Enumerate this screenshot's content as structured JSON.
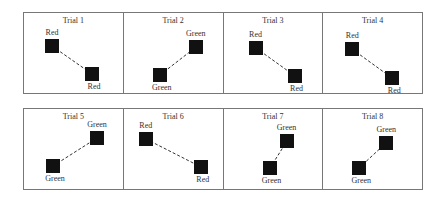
{
  "trials": [
    {
      "title": "Trial 1",
      "a": {
        "x": 21,
        "y": 26,
        "label": "Red",
        "label_pos": "above"
      },
      "b": {
        "x": 61,
        "y": 54,
        "label": "Red",
        "label_pos": "below"
      }
    },
    {
      "title": "Trial 2",
      "a": {
        "x": 29,
        "y": 55,
        "label": "Green",
        "label_pos": "below"
      },
      "b": {
        "x": 65,
        "y": 27,
        "label": "Green",
        "label_pos": "above"
      }
    },
    {
      "title": "Trial 3",
      "a": {
        "x": 25,
        "y": 28,
        "label": "Red",
        "label_pos": "above"
      },
      "b": {
        "x": 64,
        "y": 56,
        "label": "Red",
        "label_pos": "below"
      }
    },
    {
      "title": "Trial 4",
      "a": {
        "x": 22,
        "y": 29,
        "label": "Red",
        "label_pos": "above"
      },
      "b": {
        "x": 62,
        "y": 58,
        "label": "Red",
        "label_pos": "below"
      }
    },
    {
      "title": "Trial 5",
      "a": {
        "x": 22,
        "y": 50,
        "label": "Green",
        "label_pos": "below"
      },
      "b": {
        "x": 66,
        "y": 22,
        "label": "Green",
        "label_pos": "above"
      }
    },
    {
      "title": "Trial 6",
      "a": {
        "x": 15,
        "y": 23,
        "label": "Red",
        "label_pos": "above"
      },
      "b": {
        "x": 70,
        "y": 51,
        "label": "Red",
        "label_pos": "below"
      }
    },
    {
      "title": "Trial 7",
      "a": {
        "x": 39,
        "y": 52,
        "label": "Green",
        "label_pos": "below"
      },
      "b": {
        "x": 56,
        "y": 25,
        "label": "Green",
        "label_pos": "above"
      }
    },
    {
      "title": "Trial 8",
      "a": {
        "x": 29,
        "y": 52,
        "label": "Green",
        "label_pos": "below"
      },
      "b": {
        "x": 56,
        "y": 27,
        "label": "Green",
        "label_pos": "above"
      }
    }
  ],
  "colors": {
    "square": "#111111",
    "border": "#777777",
    "text": "#333333"
  }
}
